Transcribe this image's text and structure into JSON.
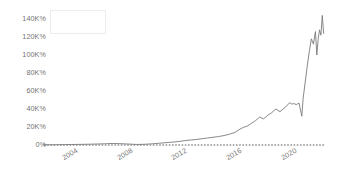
{
  "chart_data": {
    "type": "line",
    "title": "",
    "subtitle": "",
    "xlabel": "",
    "ylabel": "",
    "grid": false,
    "legend_position": "top-left",
    "legend_entries": [],
    "legend_label": "",
    "baseline_value": "0%",
    "baseline_style": "dashed",
    "line_color": "#7a7a7a",
    "xlim": [
      2002,
      2022.6
    ],
    "ylim": [
      0,
      150000
    ],
    "yticks": [
      0,
      20000,
      40000,
      60000,
      80000,
      100000,
      120000,
      140000
    ],
    "ytick_labels": [
      "0%",
      "20K%",
      "40K%",
      "60K%",
      "80K%",
      "100K%",
      "120K%",
      "140K%"
    ],
    "xticks": [
      2004,
      2008,
      2012,
      2016,
      2020
    ],
    "xtick_labels": [
      "2004",
      "2008",
      "2012",
      "2016",
      "2020"
    ],
    "series": [
      {
        "name": "",
        "x": [
          2002.0,
          2002.5,
          2003.0,
          2003.5,
          2004.0,
          2004.5,
          2005.0,
          2005.5,
          2006.0,
          2006.5,
          2007.0,
          2007.5,
          2008.0,
          2008.4,
          2008.8,
          2009.2,
          2009.6,
          2010.0,
          2010.4,
          2010.8,
          2011.2,
          2011.6,
          2012.0,
          2012.4,
          2012.8,
          2013.2,
          2013.6,
          2014.0,
          2014.4,
          2014.8,
          2015.2,
          2015.6,
          2016.0,
          2016.3,
          2016.6,
          2016.9,
          2017.2,
          2017.5,
          2017.8,
          2018.1,
          2018.4,
          2018.7,
          2019.0,
          2019.3,
          2019.6,
          2019.9,
          2020.0,
          2020.15,
          2020.3,
          2020.5,
          2020.7,
          2020.9,
          2021.0,
          2021.15,
          2021.3,
          2021.45,
          2021.6,
          2021.75,
          2021.9,
          2022.0,
          2022.1,
          2022.2,
          2022.3,
          2022.4,
          2022.5
        ],
        "y": [
          200,
          260,
          330,
          420,
          520,
          640,
          780,
          950,
          1150,
          1400,
          1700,
          1500,
          1200,
          900,
          600,
          700,
          1000,
          1400,
          1900,
          2400,
          2900,
          3400,
          4200,
          5000,
          5600,
          6200,
          7000,
          7800,
          8600,
          9400,
          10500,
          12000,
          14000,
          17000,
          19500,
          21000,
          24000,
          27000,
          31000,
          29000,
          33000,
          36000,
          40000,
          37000,
          41000,
          45000,
          47000,
          45500,
          46000,
          45000,
          46500,
          32000,
          52000,
          70000,
          88000,
          104000,
          118000,
          112000,
          126000,
          100000,
          118000,
          128000,
          122000,
          144000,
          124000
        ]
      }
    ]
  },
  "legend": {
    "label": ""
  }
}
